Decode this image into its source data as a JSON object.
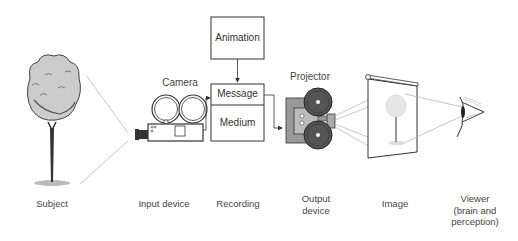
{
  "diagram": {
    "type": "process-flow",
    "boxes": {
      "animation": "Animation",
      "message": "Message",
      "medium": "Medium"
    },
    "device_labels": {
      "camera": "Camera",
      "projector": "Projector"
    },
    "stages": [
      {
        "id": "subject",
        "label": "Subject"
      },
      {
        "id": "input",
        "label": "Input device"
      },
      {
        "id": "recording",
        "label": "Recording"
      },
      {
        "id": "output",
        "label": "Output device",
        "line1": "Output",
        "line2": "device"
      },
      {
        "id": "image",
        "label": "Image"
      },
      {
        "id": "viewer",
        "label": "Viewer (brain and perception)",
        "line1": "Viewer",
        "line2": "(brain and",
        "line3": "perception)"
      }
    ],
    "edges": [
      {
        "from": "subject",
        "to": "camera"
      },
      {
        "from": "animation",
        "to": "message"
      },
      {
        "from": "camera",
        "to": "message"
      },
      {
        "from": "message",
        "to": "projector"
      },
      {
        "from": "projector",
        "to": "image"
      },
      {
        "from": "image",
        "to": "viewer"
      }
    ]
  }
}
